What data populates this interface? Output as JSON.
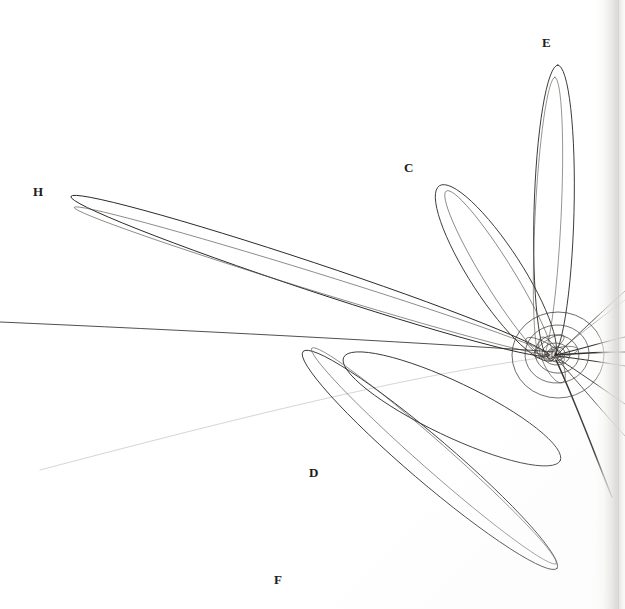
{
  "plate": {
    "kind": "astronomical-plate",
    "subject": "Cometary orbits converging on the Sun",
    "background_color": "#ffffff",
    "ink_color": "#262220",
    "width": 625,
    "height": 609
  },
  "labels": [
    {
      "id": "H",
      "text": "H",
      "x": 33,
      "y": 185
    },
    {
      "id": "C",
      "text": "C",
      "x": 404,
      "y": 161
    },
    {
      "id": "E",
      "text": "E",
      "x": 542,
      "y": 36
    },
    {
      "id": "D",
      "text": "D",
      "x": 309,
      "y": 466
    },
    {
      "id": "F",
      "text": "F",
      "x": 274,
      "y": 573
    }
  ],
  "chart_data": {
    "type": "scatter",
    "title": "",
    "subtitle": "",
    "xlabel": "",
    "ylabel": "",
    "xlim": [
      0,
      625
    ],
    "ylim": [
      0,
      609
    ],
    "grid": false,
    "legend": "none",
    "annotations": [
      "C",
      "D",
      "E",
      "F",
      "H"
    ],
    "focus": {
      "name": "Sun",
      "x": 558,
      "y": 355
    },
    "planet_orbits": [
      {
        "name": "inner-orbit-1",
        "rx": 5,
        "ry": 4,
        "rotation": -20
      },
      {
        "name": "inner-orbit-2",
        "rx": 9,
        "ry": 7,
        "rotation": -10
      },
      {
        "name": "inner-orbit-3",
        "rx": 14,
        "ry": 11,
        "rotation": 5
      },
      {
        "name": "orbit-4",
        "rx": 22,
        "ry": 19,
        "rotation": 10
      },
      {
        "name": "orbit-5",
        "rx": 32,
        "ry": 29,
        "rotation": -5
      },
      {
        "name": "orbit-6",
        "rx": 46,
        "ry": 43,
        "rotation": 0
      }
    ],
    "comet_orbits": [
      {
        "label": "H",
        "aphelion": {
          "x": 63,
          "y": 197
        },
        "semi_major": 252,
        "semi_minor": 14,
        "angle_deg": 18.5,
        "stroke_width": 0.85
      },
      {
        "label": "C",
        "aphelion": {
          "x": 437,
          "y": 192
        },
        "semi_major": 104,
        "semi_minor": 26,
        "angle_deg": 56,
        "stroke_width": 0.8
      },
      {
        "label": "E",
        "aphelion": {
          "x": 552,
          "y": 70
        },
        "semi_major": 146,
        "semi_minor": 20,
        "angle_deg": 88.5,
        "stroke_width": 0.85
      },
      {
        "label": "D",
        "aphelion": {
          "x": 348,
          "y": 460
        },
        "semi_major": 119,
        "semi_minor": 27,
        "angle_deg": -26,
        "stroke_width": 0.8
      },
      {
        "label": "F",
        "aphelion": {
          "x": 305,
          "y": 562
        },
        "semi_major": 166,
        "semi_minor": 22,
        "angle_deg": -40.5,
        "stroke_width": 0.8
      }
    ],
    "open_trajectories": [
      {
        "name": "ray-east-upper",
        "exit_x": 625,
        "exit_y": 292
      },
      {
        "name": "ray-east-mid-upper",
        "exit_x": 625,
        "exit_y": 337
      },
      {
        "name": "ray-east",
        "exit_x": 625,
        "exit_y": 352
      },
      {
        "name": "ray-east-lower",
        "exit_x": 625,
        "exit_y": 366
      },
      {
        "name": "ray-southeast-1",
        "exit_x": 625,
        "exit_y": 404
      },
      {
        "name": "ray-southeast-2",
        "exit_x": 625,
        "exit_y": 436
      },
      {
        "name": "ray-southeast-3",
        "exit_x": 612,
        "exit_y": 497
      },
      {
        "name": "ray-west",
        "exit_x": 0,
        "exit_y": 322
      }
    ]
  }
}
